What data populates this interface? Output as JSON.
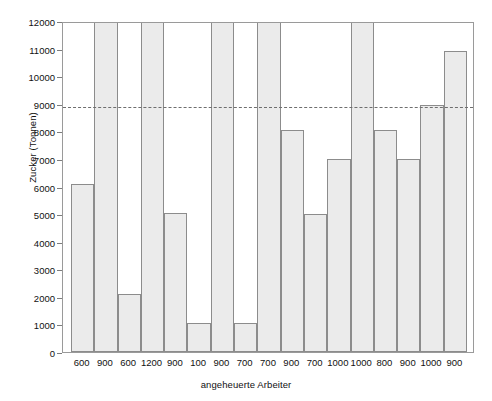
{
  "chart_data": {
    "type": "bar",
    "title": "",
    "subtitle": "",
    "xlabel": "angeheuerte Arbeiter",
    "ylabel": "Zucker (Tonnen)",
    "categories": [
      "600",
      "900",
      "600",
      "1200",
      "900",
      "100",
      "900",
      "700",
      "700",
      "900",
      "700",
      "1000",
      "1000",
      "800",
      "900",
      "1000",
      "900"
    ],
    "values": [
      6100,
      11950,
      2100,
      11950,
      5050,
      1050,
      11950,
      1050,
      11950,
      8050,
      5000,
      6980,
      11950,
      8050,
      6980,
      8950,
      10900
    ],
    "series": [
      {
        "name": "Zucker (Tonnen)",
        "values": [
          6100,
          11950,
          2100,
          11950,
          5050,
          1050,
          11950,
          1050,
          11950,
          8050,
          5000,
          6980,
          11950,
          8050,
          6980,
          8950,
          10900
        ]
      }
    ],
    "ylim": [
      0,
      12000
    ],
    "ytick_values": [
      0,
      1000,
      2000,
      3000,
      4000,
      5000,
      6000,
      7000,
      8000,
      9000,
      10000,
      11000,
      12000
    ],
    "ytick_labels": [
      "0",
      "1000",
      "2000",
      "3000",
      "4000",
      "5000",
      "6000",
      "7000",
      "8000",
      "9000",
      "10000",
      "11000",
      "12000"
    ],
    "grid": false,
    "legend": null,
    "annotations": [
      {
        "name": "mean-reference-line",
        "style": "dashed",
        "orientation": "horizontal",
        "value": 8950,
        "label": ""
      }
    ],
    "colors": {
      "bar_fill": "#ebebeb",
      "bar_stroke": "#8c8c8c",
      "axis": "#9a9a9a",
      "reference_line": "#6e6e6e",
      "text": "#111111",
      "background": "#ffffff"
    }
  }
}
